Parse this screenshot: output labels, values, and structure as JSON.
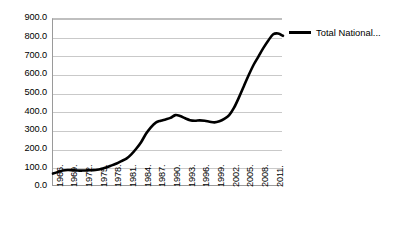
{
  "chart_data": {
    "type": "line",
    "title": "",
    "subtitle": "",
    "xlabel": "",
    "ylabel": "",
    "grid": true,
    "legend_position": "right",
    "ylim": [
      0,
      900
    ],
    "ytick_labels": [
      "900.0",
      "800.0",
      "700.0",
      "600.0",
      "500.0",
      "400.0",
      "300.0",
      "200.0",
      "100.0",
      "0.0"
    ],
    "ytick_values": [
      900,
      800,
      700,
      600,
      500,
      400,
      300,
      200,
      100,
      0
    ],
    "xtick_labels": [
      "1966.",
      "1969.",
      "1972.",
      "1975.",
      "1978.",
      "1981.",
      "1984.",
      "1987.",
      "1990.",
      "1993.",
      "1996.",
      "1999.",
      "2002.",
      "2005.",
      "2008.",
      "2011."
    ],
    "xtick_values": [
      1966,
      1969,
      1972,
      1975,
      1978,
      1981,
      1984,
      1987,
      1990,
      1993,
      1996,
      1999,
      2002,
      2005,
      2008,
      2011
    ],
    "xlim": [
      1966,
      2013
    ],
    "x": [
      1966,
      1967,
      1968,
      1969,
      1970,
      1971,
      1972,
      1973,
      1974,
      1975,
      1976,
      1977,
      1978,
      1979,
      1980,
      1981,
      1982,
      1983,
      1984,
      1985,
      1986,
      1987,
      1988,
      1989,
      1990,
      1991,
      1992,
      1993,
      1994,
      1995,
      1996,
      1997,
      1998,
      1999,
      2000,
      2001,
      2002,
      2003,
      2004,
      2005,
      2006,
      2007,
      2008,
      2009,
      2010,
      2011,
      2012,
      2013
    ],
    "series": [
      {
        "name": "Total National...",
        "color": "#000000",
        "values": [
          72,
          80,
          88,
          91,
          90,
          88,
          88,
          89,
          90,
          92,
          98,
          106,
          116,
          126,
          139,
          152,
          175,
          205,
          240,
          285,
          320,
          345,
          355,
          362,
          370,
          385,
          380,
          368,
          358,
          355,
          357,
          355,
          350,
          346,
          352,
          365,
          385,
          425,
          480,
          540,
          600,
          655,
          700,
          745,
          785,
          818,
          822,
          810
        ]
      }
    ],
    "legend": [
      {
        "label": "Total National...",
        "color": "#000000"
      }
    ],
    "colors": {
      "series_line": "#000000",
      "gridline": "#c9c9c9",
      "axis": "#9a9a9a",
      "background": "#ffffff",
      "text": "#000000"
    }
  }
}
